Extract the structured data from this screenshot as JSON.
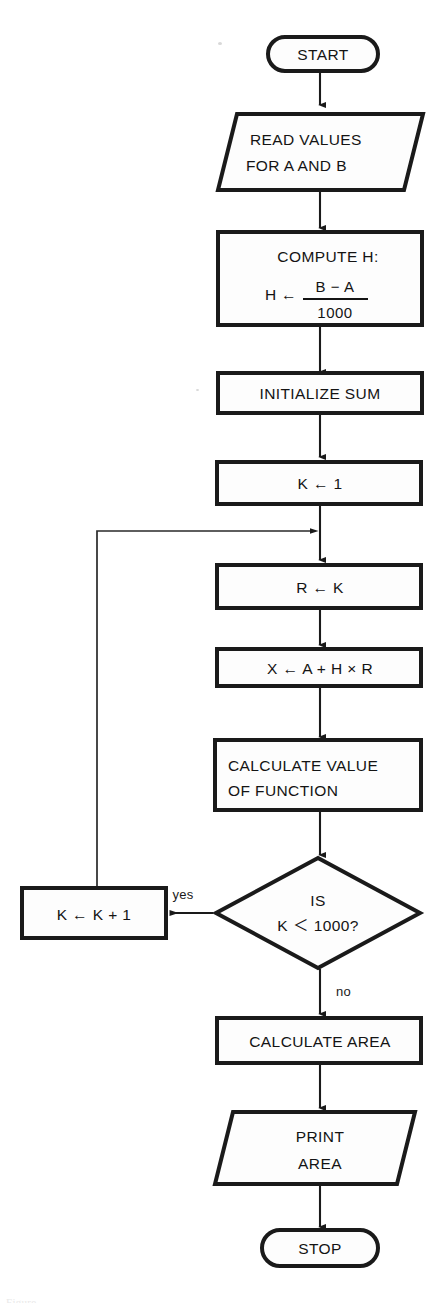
{
  "figure": {
    "kind": "flowchart",
    "background_color": "#ffffff",
    "ink_color": "#1a1a1a",
    "caption_partial": "Figure"
  },
  "nodes": [
    {
      "id": "start",
      "shape": "terminator",
      "label": "START",
      "lines": [
        "START"
      ]
    },
    {
      "id": "read",
      "shape": "parallelogram",
      "label": "READ VALUES FOR A AND B",
      "lines": [
        "READ VALUES",
        "FOR A AND B"
      ]
    },
    {
      "id": "compute-h",
      "shape": "process",
      "label": "COMPUTE H: H <- (B - A) / 1000",
      "lines": [
        "COMPUTE H:"
      ],
      "formula": {
        "lhs": "H",
        "arrow": "←",
        "numerator": "B − A",
        "denominator": "1000"
      }
    },
    {
      "id": "init-sum",
      "shape": "process",
      "label": "INITIALIZE SUM",
      "lines": [
        "INITIALIZE SUM"
      ]
    },
    {
      "id": "k-init",
      "shape": "process",
      "label": "K ← 1",
      "lines": [
        "K ← 1"
      ]
    },
    {
      "id": "r-assign",
      "shape": "process",
      "label": "R ← K",
      "lines": [
        "R ← K"
      ]
    },
    {
      "id": "x-assign",
      "shape": "process",
      "label": "X ← A + H × R",
      "lines": [
        "X ← A + H × R"
      ]
    },
    {
      "id": "calc-value",
      "shape": "process",
      "label": "CALCULATE VALUE OF FUNCTION",
      "lines": [
        "CALCULATE VALUE",
        "OF FUNCTION"
      ]
    },
    {
      "id": "decision",
      "shape": "decision",
      "label": "IS K < 1000?",
      "lines": [
        "IS",
        "K ＜ 1000?"
      ]
    },
    {
      "id": "k-increment",
      "shape": "process",
      "label": "K ← K + 1",
      "lines": [
        "K ← K + 1"
      ]
    },
    {
      "id": "calc-area",
      "shape": "process",
      "label": "CALCULATE AREA",
      "lines": [
        "CALCULATE AREA"
      ]
    },
    {
      "id": "print-area",
      "shape": "parallelogram",
      "label": "PRINT AREA",
      "lines": [
        "PRINT",
        "AREA"
      ]
    },
    {
      "id": "stop",
      "shape": "terminator",
      "label": "STOP",
      "lines": [
        "STOP"
      ]
    }
  ],
  "edge_labels": {
    "yes": "yes",
    "no": "no"
  }
}
